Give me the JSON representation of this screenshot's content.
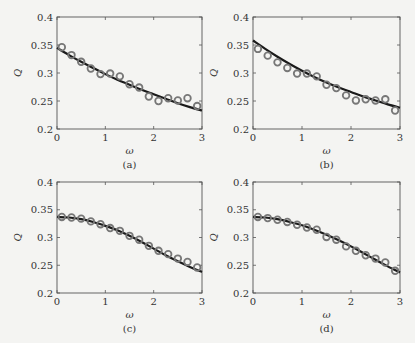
{
  "figure": {
    "layout": "2x2 grid",
    "panels": [
      "a",
      "b",
      "c",
      "d"
    ]
  },
  "chart_data": [
    {
      "type": "line",
      "panel_label": "(a)",
      "xlabel": "ω",
      "ylabel": "Q",
      "xlim": [
        0,
        3
      ],
      "ylim": [
        0.2,
        0.4
      ],
      "xticks": [
        "0",
        "1",
        "2",
        "3"
      ],
      "yticks": [
        "0.2",
        "0.25",
        "0.3",
        "0.35",
        "0.4"
      ],
      "grid": false,
      "series": [
        {
          "name": "simulation",
          "style": "open-circle markers",
          "x": [
            0.1,
            0.3,
            0.5,
            0.7,
            0.9,
            1.1,
            1.3,
            1.5,
            1.7,
            1.9,
            2.1,
            2.3,
            2.5,
            2.7,
            2.9
          ],
          "values": [
            0.346,
            0.332,
            0.32,
            0.308,
            0.298,
            0.299,
            0.294,
            0.28,
            0.274,
            0.258,
            0.25,
            0.255,
            0.251,
            0.255,
            0.241
          ]
        },
        {
          "name": "theory",
          "style": "solid line",
          "x": [
            0,
            0.25,
            0.5,
            0.75,
            1,
            1.25,
            1.5,
            1.75,
            2,
            2.25,
            2.5,
            2.75,
            3
          ],
          "values": [
            0.345,
            0.332,
            0.32,
            0.309,
            0.298,
            0.288,
            0.279,
            0.27,
            0.262,
            0.254,
            0.246,
            0.239,
            0.233
          ]
        }
      ]
    },
    {
      "type": "line",
      "panel_label": "(b)",
      "xlabel": "ω",
      "ylabel": "Q",
      "xlim": [
        0,
        3
      ],
      "ylim": [
        0.2,
        0.4
      ],
      "xticks": [
        "0",
        "1",
        "2",
        "3"
      ],
      "yticks": [
        "0.2",
        "0.25",
        "0.3",
        "0.35",
        "0.4"
      ],
      "grid": false,
      "series": [
        {
          "name": "simulation",
          "style": "open-circle markers",
          "x": [
            0.1,
            0.3,
            0.5,
            0.7,
            0.9,
            1.1,
            1.3,
            1.5,
            1.7,
            1.9,
            2.1,
            2.3,
            2.5,
            2.7,
            2.9
          ],
          "values": [
            0.343,
            0.331,
            0.319,
            0.309,
            0.299,
            0.299,
            0.294,
            0.279,
            0.273,
            0.26,
            0.251,
            0.253,
            0.251,
            0.253,
            0.233
          ]
        },
        {
          "name": "theory",
          "style": "solid line",
          "x": [
            0,
            0.25,
            0.5,
            0.75,
            1,
            1.25,
            1.5,
            1.75,
            2,
            2.25,
            2.5,
            2.75,
            3
          ],
          "values": [
            0.358,
            0.343,
            0.329,
            0.316,
            0.304,
            0.293,
            0.283,
            0.274,
            0.266,
            0.258,
            0.251,
            0.244,
            0.238
          ]
        }
      ]
    },
    {
      "type": "line",
      "panel_label": "(c)",
      "xlabel": "ω",
      "ylabel": "Q",
      "xlim": [
        0,
        3
      ],
      "ylim": [
        0.2,
        0.4
      ],
      "xticks": [
        "0",
        "1",
        "2",
        "3"
      ],
      "yticks": [
        "0.2",
        "0.25",
        "0.3",
        "0.35",
        "0.4"
      ],
      "grid": false,
      "series": [
        {
          "name": "simulation",
          "style": "open-circle markers",
          "x": [
            0.1,
            0.3,
            0.5,
            0.7,
            0.9,
            1.1,
            1.3,
            1.5,
            1.7,
            1.9,
            2.1,
            2.3,
            2.5,
            2.7,
            2.9
          ],
          "values": [
            0.337,
            0.336,
            0.334,
            0.329,
            0.324,
            0.317,
            0.312,
            0.303,
            0.296,
            0.285,
            0.276,
            0.27,
            0.262,
            0.256,
            0.246
          ]
        },
        {
          "name": "theory",
          "style": "solid line",
          "x": [
            0,
            0.25,
            0.5,
            0.75,
            1,
            1.25,
            1.5,
            1.75,
            2,
            2.25,
            2.5,
            2.75,
            3
          ],
          "values": [
            0.337,
            0.336,
            0.333,
            0.328,
            0.321,
            0.313,
            0.303,
            0.292,
            0.28,
            0.268,
            0.257,
            0.247,
            0.238
          ]
        }
      ]
    },
    {
      "type": "line",
      "panel_label": "(d)",
      "xlabel": "ω",
      "ylabel": "Q",
      "xlim": [
        0,
        3
      ],
      "ylim": [
        0.2,
        0.4
      ],
      "xticks": [
        "0",
        "1",
        "2",
        "3"
      ],
      "yticks": [
        "0.2",
        "0.25",
        "0.3",
        "0.35",
        "0.4"
      ],
      "grid": false,
      "series": [
        {
          "name": "simulation",
          "style": "open-circle markers",
          "x": [
            0.1,
            0.3,
            0.5,
            0.7,
            0.9,
            1.1,
            1.3,
            1.5,
            1.7,
            1.9,
            2.1,
            2.3,
            2.5,
            2.7,
            2.9
          ],
          "values": [
            0.337,
            0.335,
            0.332,
            0.328,
            0.323,
            0.318,
            0.314,
            0.301,
            0.296,
            0.284,
            0.276,
            0.268,
            0.262,
            0.255,
            0.24
          ]
        },
        {
          "name": "theory",
          "style": "solid line",
          "x": [
            0,
            0.25,
            0.5,
            0.75,
            1,
            1.25,
            1.5,
            1.75,
            2,
            2.25,
            2.5,
            2.75,
            3
          ],
          "values": [
            0.337,
            0.336,
            0.333,
            0.328,
            0.322,
            0.314,
            0.305,
            0.295,
            0.284,
            0.272,
            0.26,
            0.248,
            0.237
          ]
        }
      ]
    }
  ]
}
